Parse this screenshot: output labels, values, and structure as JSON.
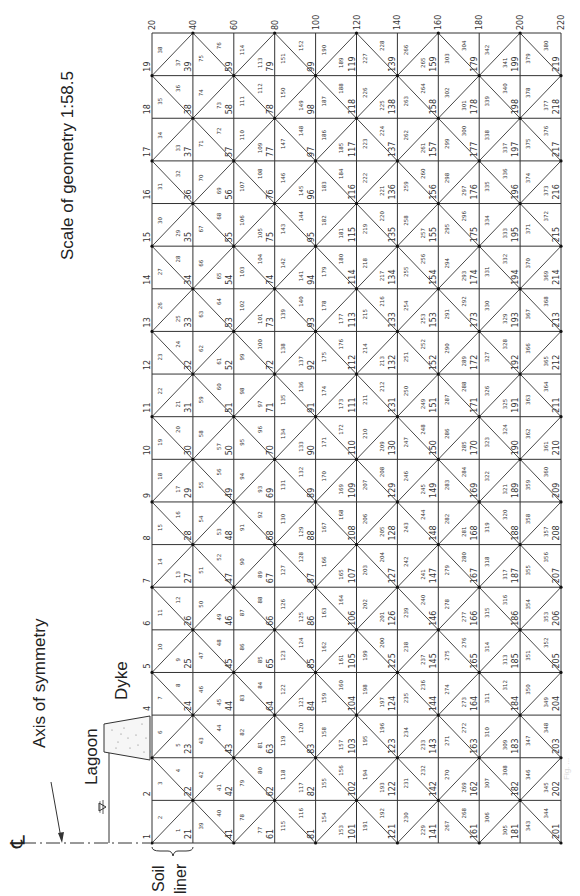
{
  "figure": {
    "scale_label": "Scale of geometry  1:58.5",
    "axis_label": "Axis of symmetry",
    "lagoon_label": "Lagoon",
    "dyke_label": "Dyke",
    "soil_label": "Soil",
    "liner_label": "liner",
    "centerline_symbol": "℄",
    "water_level_symbol": "▽",
    "caption_faint": "Fig. ..."
  },
  "mesh": {
    "columns": 10,
    "rows": 19,
    "x0": 152,
    "x1": 561,
    "y_top": 33,
    "y_bottom": 843,
    "nodes_per_column": 20,
    "elements_per_column": 38,
    "node_count": 220,
    "element_count": 380,
    "line_color": "#333333",
    "node_dot_color": "#111111",
    "label_color": "#333333",
    "diagonal_rule": "(col+row) even -> '/', odd -> '\\'",
    "top_node_labels": [
      "20",
      "40",
      "60",
      "80",
      "100",
      "120",
      "140",
      "160",
      "180",
      "200",
      "220"
    ],
    "bottom_node_labels": [
      "1",
      "21",
      "41",
      "61",
      "81",
      "101",
      "121",
      "141",
      "161",
      "181",
      "201"
    ]
  },
  "colors": {
    "background": "#ffffff",
    "ink": "#222222",
    "dyke_fill": "#f4f4f4"
  }
}
